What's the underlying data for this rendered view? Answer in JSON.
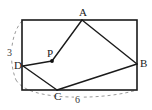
{
  "figure": {
    "kind": "geometry-diagram",
    "canvas": {
      "width": 152,
      "height": 110
    },
    "colors": {
      "solid_stroke": "#1a1a1a",
      "dashed_stroke": "#9a9a9a",
      "point_fill": "#111111",
      "label_text": "#1a1a1a",
      "background": "#ffffff"
    },
    "rectangle": {
      "name": "bounding-rectangle",
      "x": 22,
      "y": 20,
      "width": 115,
      "height": 70,
      "stroke_width": 1.6
    },
    "points": [
      {
        "id": "A",
        "label": "A",
        "x": 82,
        "y": 20,
        "on": "top-edge",
        "label_dx": -3,
        "label_dy": -13,
        "marker": false
      },
      {
        "id": "B",
        "label": "B",
        "x": 137,
        "y": 64,
        "on": "right-edge",
        "label_dx": 3,
        "label_dy": -6,
        "marker": false
      },
      {
        "id": "C",
        "label": "C",
        "x": 57,
        "y": 90,
        "on": "bottom-edge",
        "label_dx": -3,
        "label_dy": 1,
        "marker": false
      },
      {
        "id": "D",
        "label": "D",
        "x": 23,
        "y": 66,
        "on": "left-edge",
        "label_dx": -9,
        "label_dy": -6,
        "marker": false
      },
      {
        "id": "P",
        "label": "P",
        "x": 52,
        "y": 61,
        "on": "interior",
        "label_dx": -5,
        "label_dy": -13,
        "marker": true
      }
    ],
    "segments": [
      {
        "name": "segment-A-P",
        "from": "A",
        "to": "P"
      },
      {
        "name": "segment-P-D",
        "from": "P",
        "to": "D"
      },
      {
        "name": "segment-A-B",
        "from": "A",
        "to": "B"
      },
      {
        "name": "segment-D-C",
        "from": "D",
        "to": "C"
      },
      {
        "name": "segment-C-B",
        "from": "C",
        "to": "B"
      }
    ],
    "dashed_arcs": [
      {
        "name": "left-arc",
        "d": "M 22 21 C 11 33, 8 60, 16 80",
        "dasharray": "3 3"
      },
      {
        "name": "bottom-arc",
        "d": "M 16 80 C 22 90, 40 96, 70 97 C 100 98, 124 94, 137 90",
        "dasharray": "3 3"
      }
    ],
    "measures": [
      {
        "id": "m1",
        "text": "3",
        "x": 6,
        "y": 48,
        "near": "left-arc"
      },
      {
        "id": "m2",
        "text": "6",
        "x": 74,
        "y": 95,
        "near": "bottom-arc"
      }
    ]
  }
}
